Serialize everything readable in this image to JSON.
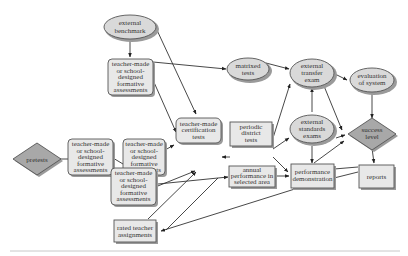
{
  "colors": {
    "box_fill": "#e8e8e8",
    "oval_fill": "#d9d9d9",
    "diamond_fill": "#a8a8a8",
    "stroke": "#555555",
    "edge": "#333333",
    "text": "#333333"
  },
  "nodes": {
    "external_benchmark": {
      "shape": "ellipse",
      "lines": [
        "external",
        "benchmark"
      ]
    },
    "formative_top": {
      "shape": "rounded-box",
      "lines": [
        "teacher-made",
        "or school-",
        "designed",
        "formative",
        "assessments"
      ]
    },
    "pretests": {
      "shape": "diamond",
      "lines": [
        "pretests"
      ]
    },
    "formative_left": {
      "shape": "rounded-box",
      "lines": [
        "teacher-made",
        "or school-",
        "designed",
        "formative",
        "assessments"
      ]
    },
    "formative_mid": {
      "shape": "rounded-box",
      "lines": [
        "teacher-made",
        "or school-",
        "designed",
        "formative",
        "assessments"
      ]
    },
    "formative_bottom": {
      "shape": "rounded-box",
      "lines": [
        "teacher-made",
        "or school-",
        "designed",
        "formative",
        "assessments"
      ]
    },
    "certification_tests": {
      "shape": "rounded-box",
      "lines": [
        "teacher-made",
        "certification",
        "tests"
      ]
    },
    "rated_assignments": {
      "shape": "box",
      "lines": [
        "rated teacher",
        "assignments"
      ]
    },
    "matrixed_tests": {
      "shape": "ellipse",
      "lines": [
        "matrixed",
        "tests"
      ]
    },
    "periodic_district": {
      "shape": "box",
      "lines": [
        "periodic",
        "district",
        "tests"
      ]
    },
    "annual_performance": {
      "shape": "box",
      "lines": [
        "annual",
        "performance in",
        "selected area"
      ]
    },
    "external_transfer": {
      "shape": "ellipse",
      "lines": [
        "external",
        "transfer",
        "exam"
      ]
    },
    "external_standards": {
      "shape": "ellipse",
      "lines": [
        "external",
        "standards",
        "exams"
      ]
    },
    "performance_demo": {
      "shape": "box",
      "lines": [
        "performance",
        "demonstration"
      ]
    },
    "evaluation_system": {
      "shape": "ellipse",
      "lines": [
        "evaluation",
        "of system"
      ]
    },
    "success_level": {
      "shape": "diamond",
      "lines": [
        "success",
        "level"
      ]
    },
    "reports": {
      "shape": "box",
      "lines": [
        "reports"
      ]
    }
  }
}
